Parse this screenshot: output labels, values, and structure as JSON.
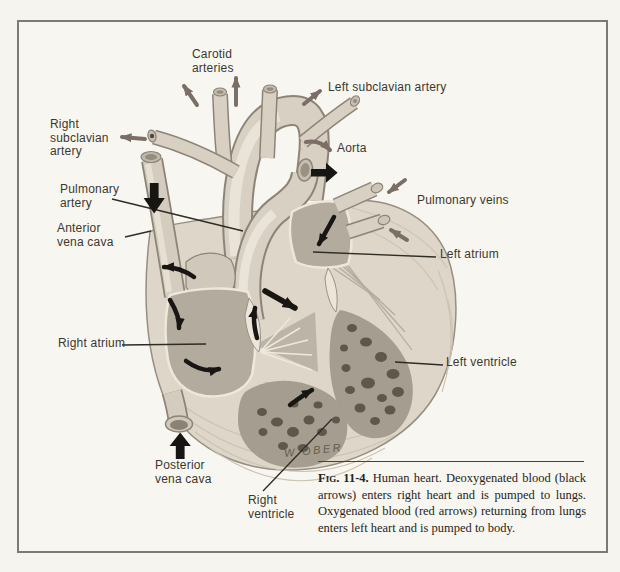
{
  "figure": {
    "caption": {
      "label": "Fig. 11-4.",
      "text": "Human heart. Deoxygenated blood (black arrows) enters right heart and is pumped to lungs. Oxygenated blood (red arrows) returning from lungs enters left heart and is pumped to body."
    },
    "signature": "W.OBER",
    "labels": [
      {
        "id": "carotid-arteries",
        "text": "Carotid\narteries"
      },
      {
        "id": "left-subclavian-artery",
        "text": "Left subclavian artery"
      },
      {
        "id": "right-subclavian-artery",
        "text": "Right\nsubclavian\nartery"
      },
      {
        "id": "aorta",
        "text": "Aorta"
      },
      {
        "id": "pulmonary-artery",
        "text": "Pulmonary\nartery"
      },
      {
        "id": "pulmonary-veins",
        "text": "Pulmonary veins"
      },
      {
        "id": "anterior-vena-cava",
        "text": "Anterior\nvena cava"
      },
      {
        "id": "left-atrium",
        "text": "Left atrium"
      },
      {
        "id": "right-atrium",
        "text": "Right atrium"
      },
      {
        "id": "left-ventricle",
        "text": "Left ventricle"
      },
      {
        "id": "posterior-vena-cava",
        "text": "Posterior\nvena cava"
      },
      {
        "id": "right-ventricle",
        "text": "Right\nventricle"
      }
    ],
    "colors": {
      "red_arrows": "#7a6e66",
      "black_arrows": "#181613",
      "leader_lines": "#2f2c26",
      "frame_border": "#7c7a72",
      "background": "#f6f4ee",
      "label_text": "#3b382f"
    }
  }
}
